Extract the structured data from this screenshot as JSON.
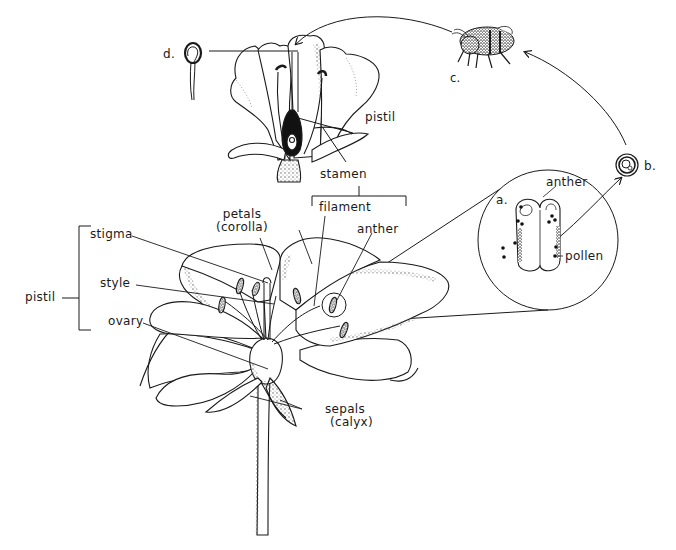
{
  "diagram": {
    "colors": {
      "ink": "#1a1a1a",
      "paper": "#ffffff",
      "stipple": "#555555"
    },
    "labels": {
      "d": "d.",
      "c": "c.",
      "b": "b.",
      "a": "a.",
      "pistil_top": "pistil",
      "stamen": "stamen",
      "filament": "filament",
      "anther_main": "anther",
      "anther_inset": "anther",
      "pollen": "pollen",
      "petals_line1": "petals",
      "petals_line2": "(corolla)",
      "stigma": "stigma",
      "style": "style",
      "ovary": "ovary",
      "pistil_left": "pistil",
      "sepals_line1": "sepals",
      "sepals_line2": "(calyx)"
    },
    "parts": {
      "cross_section_flower": "cross-section of flower",
      "bee": "bee carrying pollen",
      "pollen_grain": "pollen grain",
      "germinating_pollen": "germinating pollen tube",
      "inset_magnification": "magnified anther",
      "whole_flower": "whole flower"
    }
  }
}
